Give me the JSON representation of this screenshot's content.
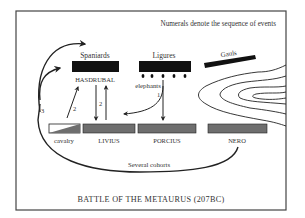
{
  "diagram": {
    "title": "BATTLE OF THE METAURUS (207BC)",
    "note": "Numerals denote the sequence of events",
    "carthaginian": {
      "spaniards": "Spaniards",
      "commander": "HASDRUBAL",
      "ligures": "Ligures",
      "elephants": "elephants",
      "gauls": "Gauls"
    },
    "roman": {
      "cavalry": "cavalry",
      "livius": "LIVIUS",
      "porcius": "PORCIUS",
      "nero": "NERO"
    },
    "movement": {
      "cohorts": "Several cohorts",
      "step1": "1",
      "step2a": "2",
      "step2b": "2",
      "step3": "3"
    },
    "colors": {
      "carthaginian_unit": "#111111",
      "roman_unit": "#6e6e6e",
      "frame": "#444444",
      "terrain": "#222222"
    }
  }
}
